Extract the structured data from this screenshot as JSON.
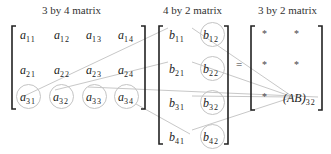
{
  "titles": {
    "a": "3 by 4 matrix",
    "b": "4 by 2 matrix",
    "ab": "3 by 2 matrix"
  },
  "matrix_a": {
    "rows": [
      [
        {
          "base": "a",
          "sub": "11"
        },
        {
          "base": "a",
          "sub": "12"
        },
        {
          "base": "a",
          "sub": "13"
        },
        {
          "base": "a",
          "sub": "14"
        }
      ],
      [
        {
          "base": "a",
          "sub": "21"
        },
        {
          "base": "a",
          "sub": "22"
        },
        {
          "base": "a",
          "sub": "23"
        },
        {
          "base": "a",
          "sub": "24"
        }
      ],
      [
        {
          "base": "a",
          "sub": "31"
        },
        {
          "base": "a",
          "sub": "32"
        },
        {
          "base": "a",
          "sub": "33"
        },
        {
          "base": "a",
          "sub": "34"
        }
      ]
    ],
    "highlighted_row": 3
  },
  "matrix_b": {
    "rows": [
      [
        {
          "base": "b",
          "sub": "11"
        },
        {
          "base": "b",
          "sub": "12"
        }
      ],
      [
        {
          "base": "b",
          "sub": "21"
        },
        {
          "base": "b",
          "sub": "22"
        }
      ],
      [
        {
          "base": "b",
          "sub": "31"
        },
        {
          "base": "b",
          "sub": "32"
        }
      ],
      [
        {
          "base": "b",
          "sub": "41"
        },
        {
          "base": "b",
          "sub": "42"
        }
      ]
    ],
    "highlighted_column": 2
  },
  "equals": "=",
  "matrix_ab": {
    "cells": [
      "*",
      "*",
      "*",
      "*",
      "*"
    ],
    "result_label": "(AB)",
    "result_sub": "32"
  }
}
